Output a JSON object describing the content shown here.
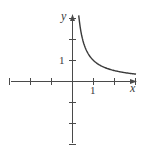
{
  "chart_data": {
    "type": "line",
    "title": "",
    "function": "y = 1/x",
    "xlabel": "x",
    "ylabel": "y",
    "xlim": [
      -3,
      3.1
    ],
    "ylim": [
      -3,
      3.2
    ],
    "grid": false,
    "legend": null,
    "x_ticks": [
      -3,
      -2,
      -1,
      1,
      2,
      3
    ],
    "y_ticks": [
      -3,
      -2,
      -1,
      1,
      2,
      3
    ],
    "tick_labels": {
      "x": [
        "1"
      ],
      "y": [
        "1"
      ]
    },
    "series": [
      {
        "name": "y = 1/x",
        "x": [
          0.32,
          0.4,
          0.5,
          0.6,
          0.75,
          1,
          1.25,
          1.5,
          2,
          2.5,
          3.05
        ],
        "y": [
          3.12,
          2.5,
          2.0,
          1.67,
          1.33,
          1.0,
          0.8,
          0.67,
          0.5,
          0.4,
          0.33
        ]
      }
    ]
  },
  "labels": {
    "x_axis": "x",
    "y_axis": "y",
    "x_tick_one": "1",
    "y_tick_one": "1"
  },
  "colors": {
    "axis": "#4a4a4a",
    "curve": "#3a3a3a"
  }
}
